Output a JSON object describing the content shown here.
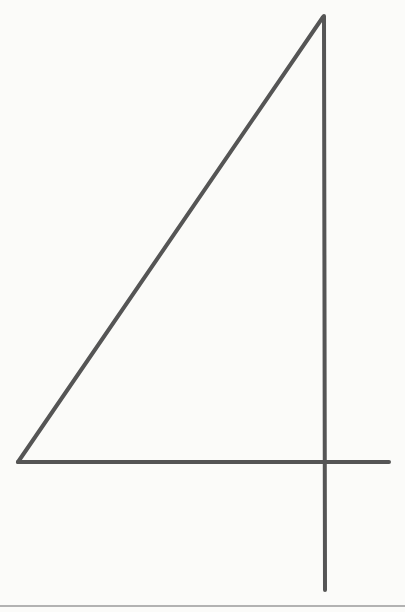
{
  "figure": {
    "stroke_color": "#555555",
    "background_color": "#fbfbf9",
    "stroke_width": 4,
    "segments": {
      "diagonal": {
        "x1": 18,
        "y1": 462,
        "x2": 323,
        "y2": 17
      },
      "vertical_stem": {
        "x1": 324,
        "y1": 16,
        "x2": 325,
        "y2": 590
      },
      "crossbar": {
        "x1": 18,
        "y1": 462,
        "x2": 389,
        "y2": 462
      }
    },
    "bottom_rule": {
      "x1": 0,
      "y1": 606,
      "x2": 405,
      "y2": 606,
      "color": "#9a9a9a"
    }
  }
}
